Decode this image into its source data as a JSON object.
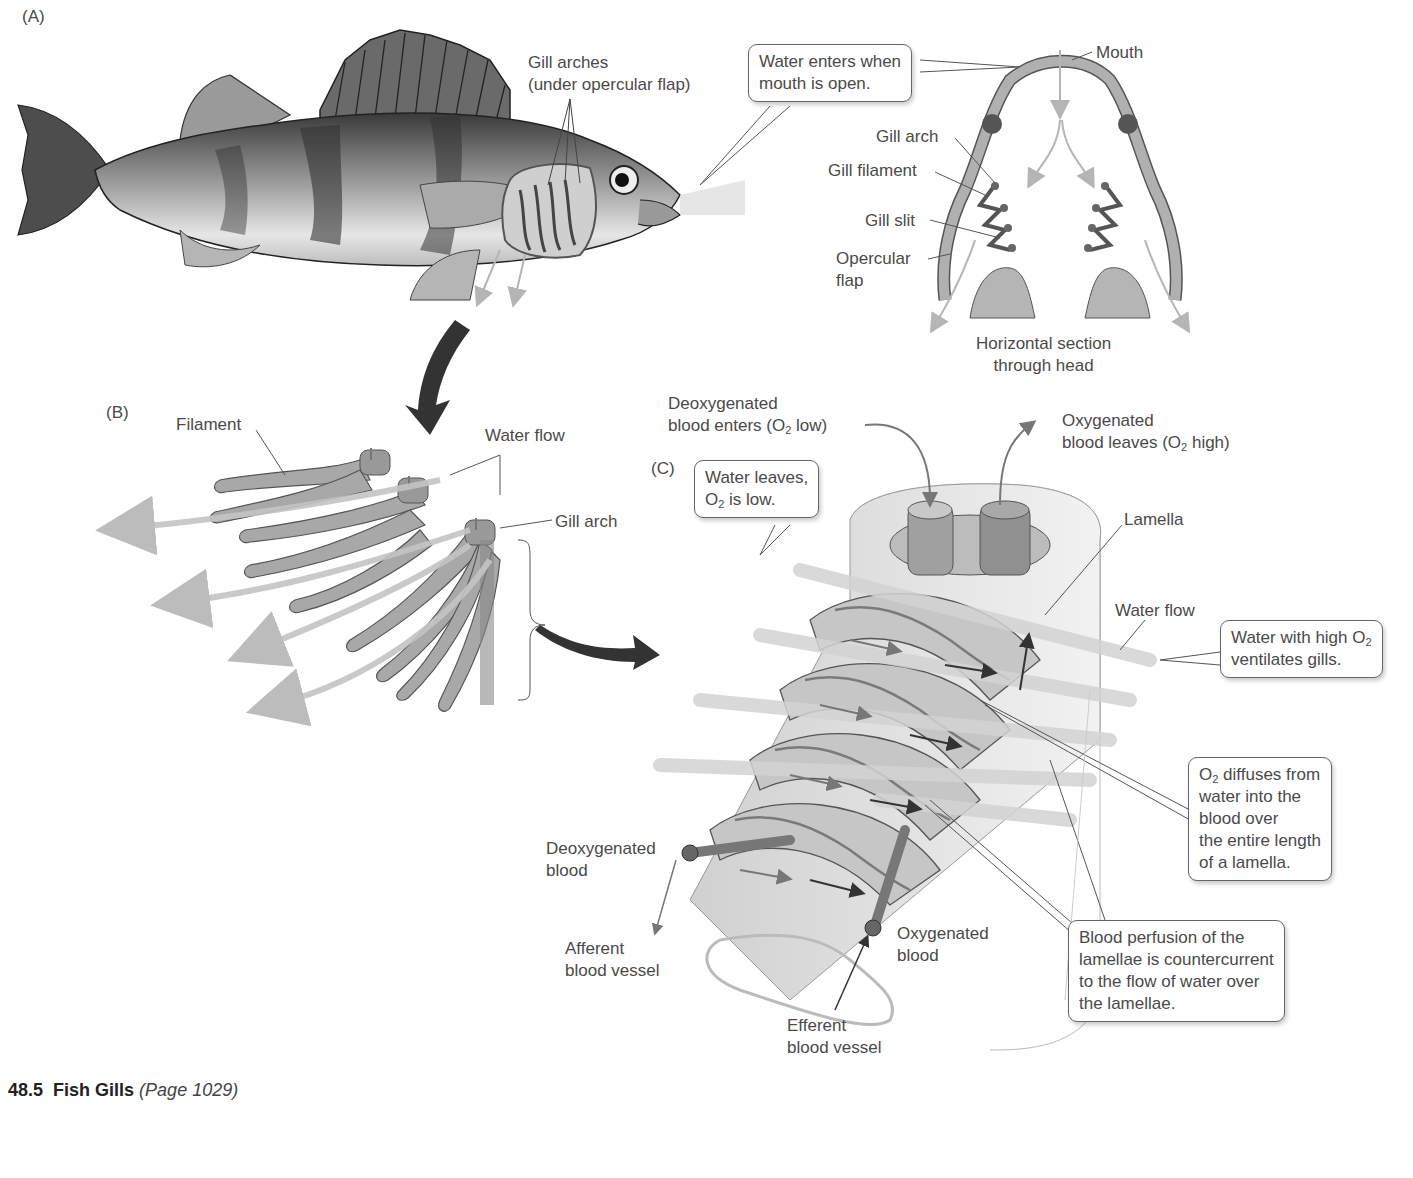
{
  "figure": {
    "caption": {
      "number": "48.5",
      "title": "Fish Gills",
      "page_ref": "(Page 1029)"
    },
    "panels": {
      "A": {
        "letter": "(A)",
        "gill_arches_line1": "Gill arches",
        "gill_arches_line2": "(under opercular flap)",
        "callout_line1": "Water enters when",
        "callout_line2": "mouth is open.",
        "mouth": "Mouth",
        "gill_arch": "Gill arch",
        "gill_filament": "Gill filament",
        "gill_slit": "Gill slit",
        "opercular_line1": "Opercular",
        "opercular_line2": "flap",
        "section_line1": "Horizontal section",
        "section_line2": "through head"
      },
      "B": {
        "letter": "(B)",
        "filament": "Filament",
        "water_flow": "Water flow",
        "gill_arch": "Gill arch"
      },
      "C": {
        "letter": "(C)",
        "deoxy_enters_line1": "Deoxygenated",
        "deoxy_enters_line2_a": "blood enters (O",
        "deoxy_enters_sub": "2",
        "deoxy_enters_line2_b": " low)",
        "oxy_leaves_line1": "Oxygenated",
        "oxy_leaves_line2_a": "blood leaves (O",
        "oxy_leaves_sub": "2",
        "oxy_leaves_line2_b": " high)",
        "water_leaves_line1": "Water leaves,",
        "water_leaves_line2_a": "O",
        "water_leaves_sub": "2",
        "water_leaves_line2_b": " is low.",
        "lamella": "Lamella",
        "water_flow": "Water flow",
        "high_o2_line1_a": "Water with high O",
        "high_o2_sub": "2",
        "high_o2_line2": "ventilates gills.",
        "diffuses_line1_a": "O",
        "diffuses_sub": "2",
        "diffuses_line1_b": " diffuses from",
        "diffuses_line2": "water into the",
        "diffuses_line3": "blood over",
        "diffuses_line4": "the entire length",
        "diffuses_line5": "of a lamella.",
        "perfusion_line1": "Blood perfusion of the",
        "perfusion_line2": "lamellae is countercurrent",
        "perfusion_line3": "to the flow of water over",
        "perfusion_line4": "the lamellae.",
        "deoxy_blood_line1": "Deoxygenated",
        "deoxy_blood_line2": "blood",
        "afferent_line1": "Afferent",
        "afferent_line2": "blood vessel",
        "oxy_blood_line1": "Oxygenated",
        "oxy_blood_line2": "blood",
        "efferent_line1": "Efferent",
        "efferent_line2": "blood vessel"
      }
    }
  }
}
